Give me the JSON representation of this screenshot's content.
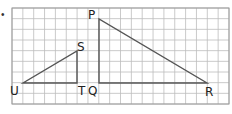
{
  "figure": {
    "bullet": "•",
    "grid": {
      "x0": 12,
      "y0": 8,
      "x1": 229,
      "y1": 104,
      "cols": 20,
      "rows": 9,
      "line_color": "#bdbdbd",
      "border_color": "#9a9a9a"
    },
    "line_color": "#555555",
    "triangles": [
      {
        "name": "STU",
        "vertices": {
          "U": [
            23,
            83
          ],
          "T": [
            77,
            83
          ],
          "S": [
            77,
            51
          ]
        }
      },
      {
        "name": "PQR",
        "vertices": {
          "P": [
            99,
            19
          ],
          "Q": [
            99,
            83
          ],
          "R": [
            207,
            83
          ]
        }
      }
    ],
    "labels": [
      {
        "text": "U",
        "x": 10,
        "y": 95
      },
      {
        "text": "T",
        "x": 78,
        "y": 95
      },
      {
        "text": "Q",
        "x": 88,
        "y": 95
      },
      {
        "text": "S",
        "x": 77,
        "y": 51
      },
      {
        "text": "P",
        "x": 88,
        "y": 19
      },
      {
        "text": "R",
        "x": 205,
        "y": 96
      }
    ]
  }
}
